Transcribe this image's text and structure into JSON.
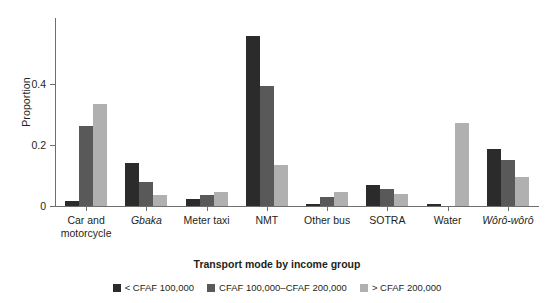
{
  "chart_data": {
    "type": "bar",
    "title": "",
    "xlabel": "Transport mode by income group",
    "ylabel": "Proportion",
    "categories": [
      "Car and motorcycle",
      "Gbaka",
      "Meter taxi",
      "NMT",
      "Other bus",
      "SOTRA",
      "Water",
      "Wôrô-wôrô"
    ],
    "categories_italic": [
      false,
      true,
      false,
      false,
      false,
      false,
      false,
      true
    ],
    "series": [
      {
        "name": "< CFAF 100,000",
        "color": "#2b2b2b",
        "values": [
          0.017,
          0.14,
          0.022,
          0.555,
          0.008,
          0.07,
          0.008,
          0.185
        ]
      },
      {
        "name": "CFAF 100,000–CFAF 200,000",
        "color": "#595959",
        "values": [
          0.262,
          0.078,
          0.036,
          0.392,
          0.03,
          0.055,
          0.0,
          0.15
        ]
      },
      {
        "name": "> CFAF 200,000",
        "color": "#b0b0b0",
        "values": [
          0.333,
          0.035,
          0.046,
          0.135,
          0.047,
          0.038,
          0.27,
          0.095
        ]
      }
    ],
    "yticks": [
      0,
      0.2,
      0.4
    ],
    "yticklabels": [
      "0",
      "0.2",
      "0.4"
    ],
    "ylim": [
      0,
      0.615
    ],
    "grid": false,
    "legend_position": "bottom"
  },
  "legend": {
    "entries": [
      {
        "label": "< CFAF 100,000",
        "color": "#2b2b2b"
      },
      {
        "label": "CFAF 100,000–CFAF 200,000",
        "color": "#595959"
      },
      {
        "label": "> CFAF 200,000",
        "color": "#b0b0b0"
      }
    ]
  }
}
